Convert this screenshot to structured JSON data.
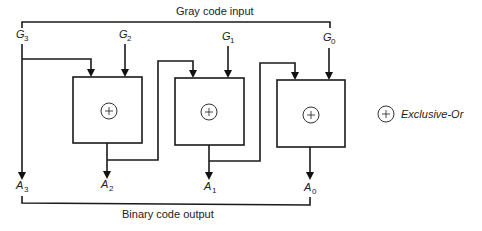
{
  "diagram": {
    "title_top": "Gray code input",
    "title_bottom": "Binary code output",
    "inputs": [
      {
        "letter": "G",
        "sub": "3"
      },
      {
        "letter": "G",
        "sub": "2"
      },
      {
        "letter": "G",
        "sub": "1"
      },
      {
        "letter": "G",
        "sub": "0"
      }
    ],
    "outputs": [
      {
        "letter": "A",
        "sub": "3"
      },
      {
        "letter": "A",
        "sub": "2"
      },
      {
        "letter": "A",
        "sub": "1"
      },
      {
        "letter": "A",
        "sub": "0"
      }
    ],
    "gates": [
      {
        "type": "xor",
        "symbol": "+"
      },
      {
        "type": "xor",
        "symbol": "+"
      },
      {
        "type": "xor",
        "symbol": "+"
      }
    ],
    "legend": {
      "symbol": "+",
      "label": "Exclusive-Or"
    },
    "colors": {
      "line": "#1a1a1a",
      "background": "#ffffff"
    }
  }
}
